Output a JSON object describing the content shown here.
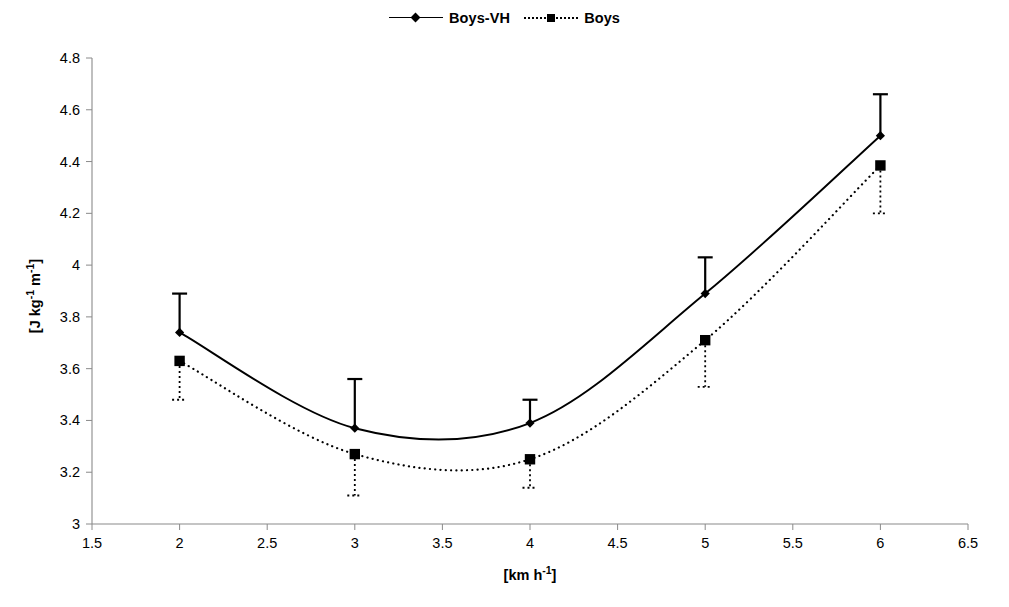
{
  "legend": {
    "items": [
      {
        "label": "Boys-VH",
        "marker": "diamond-marker-icon",
        "line": "solid"
      },
      {
        "label": "Boys",
        "marker": "square-marker-icon",
        "line": "dotted"
      }
    ]
  },
  "axes": {
    "x_title": "[km h-1]",
    "x_title_base": "[km h",
    "x_title_sup": "-1",
    "x_title_tail": "]",
    "y_title_parts": [
      "[J kg",
      "-1",
      " m",
      "-1",
      "]"
    ],
    "x_ticks": [
      "1.5",
      "2",
      "2.5",
      "3",
      "3.5",
      "4",
      "4.5",
      "5",
      "5.5",
      "6",
      "6.5"
    ],
    "y_ticks": [
      "3",
      "3.2",
      "3.4",
      "3.6",
      "3.8",
      "4",
      "4.2",
      "4.4",
      "4.6",
      "4.8"
    ]
  },
  "chart_data": {
    "type": "line",
    "title": "",
    "xlabel": "[km h-1]",
    "ylabel": "[J kg-1 m-1]",
    "xlim": [
      1.5,
      6.5
    ],
    "ylim": [
      3.0,
      4.8
    ],
    "xticks": [
      1.5,
      2,
      2.5,
      3,
      3.5,
      4,
      4.5,
      5,
      5.5,
      6,
      6.5
    ],
    "yticks": [
      3,
      3.2,
      3.4,
      3.6,
      3.8,
      4,
      4.2,
      4.4,
      4.6,
      4.8
    ],
    "grid": false,
    "legend_position": "top-center",
    "x": [
      2,
      3,
      4,
      5,
      6
    ],
    "series": [
      {
        "name": "Boys-VH",
        "marker": "diamond",
        "line_style": "solid",
        "smoothed": true,
        "values": [
          3.74,
          3.37,
          3.39,
          3.89,
          4.5
        ],
        "error_upper": [
          3.89,
          3.56,
          3.48,
          4.03,
          4.66
        ],
        "error_lower": [
          3.74,
          3.37,
          3.39,
          3.89,
          4.5
        ],
        "error_direction": "up-only"
      },
      {
        "name": "Boys",
        "marker": "square",
        "line_style": "dotted",
        "smoothed": true,
        "values": [
          3.63,
          3.27,
          3.25,
          3.71,
          4.385
        ],
        "error_upper": [
          3.63,
          3.27,
          3.25,
          3.71,
          4.385
        ],
        "error_lower": [
          3.48,
          3.11,
          3.14,
          3.53,
          4.2
        ],
        "error_direction": "down-only"
      }
    ]
  }
}
